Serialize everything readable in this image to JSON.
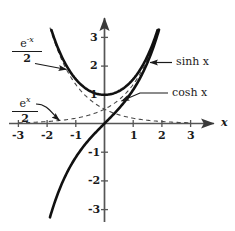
{
  "figure": {
    "kind": "hyperbolic-functions-graph",
    "background": "#ffffff",
    "ink": "#1a1a1a"
  },
  "axes": {
    "x_axis_name": "x",
    "x_ticks": [
      "-3",
      "-2",
      "-1",
      "1",
      "2",
      "3"
    ],
    "y_ticks": [
      "3",
      "2",
      "1",
      "-1",
      "-2",
      "-3"
    ],
    "xlim": [
      -3.45,
      3.9
    ],
    "ylim": [
      -3.45,
      3.6
    ],
    "origin_px": [
      104.5,
      123.5
    ],
    "unit_px": 28.7
  },
  "labels": {
    "sinh": {
      "text": "sinh x",
      "x": 176,
      "y": 62
    },
    "cosh": {
      "text": "cosh x",
      "x": 172,
      "y": 96
    },
    "e_neg_x_over_2": {
      "numerator": "e",
      "exponent": "-x",
      "denominator": "2",
      "x": 12,
      "y": 34
    },
    "e_x_over_2": {
      "numerator": "e",
      "exponent": "x",
      "denominator": "2",
      "x": 12,
      "y": 94
    }
  },
  "chart_data": {
    "type": "line",
    "title": "",
    "xlabel": "x",
    "ylabel": "",
    "xlim": [
      -3.45,
      3.9
    ],
    "ylim": [
      -3.45,
      3.6
    ],
    "xticks": [
      -3,
      -2,
      -1,
      1,
      2,
      3
    ],
    "yticks": [
      3,
      2,
      1,
      -1,
      -2,
      -3
    ],
    "grid": false,
    "legend": "inline-annotations",
    "series": [
      {
        "name": "sinh x",
        "style": "solid-bold",
        "formula": "sinh(x) = (e^x - e^-x)/2",
        "x": [
          -1.9,
          -1.6,
          -1.3,
          -1.0,
          -0.7,
          -0.4,
          -0.1,
          0,
          0.1,
          0.4,
          0.7,
          1.0,
          1.3,
          1.6,
          1.9
        ],
        "y": [
          -3.27,
          -2.38,
          -1.7,
          -1.18,
          -0.76,
          -0.41,
          -0.1,
          0,
          0.1,
          0.41,
          0.76,
          1.18,
          1.7,
          2.38,
          3.27
        ]
      },
      {
        "name": "cosh x",
        "style": "solid-bold",
        "formula": "cosh(x) = (e^x + e^-x)/2",
        "x": [
          -1.85,
          -1.5,
          -1.2,
          -0.9,
          -0.6,
          -0.3,
          0,
          0.3,
          0.6,
          0.9,
          1.2,
          1.5,
          1.85
        ],
        "y": [
          3.31,
          2.35,
          1.81,
          1.43,
          1.19,
          1.05,
          1.0,
          1.05,
          1.19,
          1.43,
          1.81,
          2.35,
          3.31
        ]
      },
      {
        "name": "e^x/2",
        "style": "dashed",
        "formula": "e^x / 2",
        "x": [
          -3.0,
          -2.5,
          -2.0,
          -1.5,
          -1.0,
          -0.5,
          0,
          0.5,
          1.0,
          1.5,
          1.9
        ],
        "y": [
          0.025,
          0.041,
          0.068,
          0.112,
          0.184,
          0.303,
          0.5,
          0.824,
          1.359,
          2.241,
          3.34
        ]
      },
      {
        "name": "e^-x/2",
        "style": "dashed",
        "formula": "e^-x / 2",
        "x": [
          -1.9,
          -1.5,
          -1.0,
          -0.5,
          0,
          0.5,
          1.0,
          1.5,
          2.0,
          2.5,
          3.0
        ],
        "y": [
          3.34,
          2.241,
          1.359,
          0.824,
          0.5,
          0.303,
          0.184,
          0.112,
          0.068,
          0.041,
          0.025
        ]
      }
    ],
    "annotations": [
      {
        "text": "sinh x",
        "points_to": [
          1.52,
          2.18
        ],
        "type": "arrow-left"
      },
      {
        "text": "cosh x",
        "points_to": [
          0.7,
          1.26
        ],
        "type": "leader-line"
      },
      {
        "text": "e^-x/2",
        "points_to": [
          -1.28,
          1.82
        ],
        "type": "arrow-right"
      },
      {
        "text": "e^x/2",
        "points_to": [
          -1.8,
          0.08
        ],
        "type": "curved-arrow"
      }
    ]
  }
}
